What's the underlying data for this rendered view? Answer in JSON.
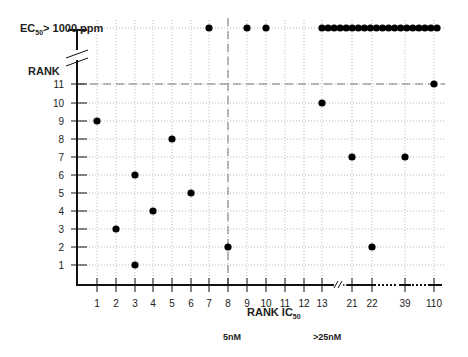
{
  "chart_data": {
    "type": "scatter",
    "title": "",
    "xlabel": "RANK IC50",
    "ylabel": "RANK",
    "top_band_label": "EC50 > 1000 ppm",
    "y_axis_label_main": "EC",
    "y_axis_label_sub": "50",
    "y_axis_label_rest": "> 1000 ppm",
    "x_axis_label_main": "RANK  IC",
    "x_axis_label_sub": "50",
    "annotations": [
      {
        "text": "5nM",
        "at_x_rank": 8
      },
      {
        "text": ">25nM",
        "at_x_rank": 13
      }
    ],
    "x_ticks": [
      "1",
      "2",
      "3",
      "4",
      "5",
      "6",
      "7",
      "8",
      "9",
      "10",
      "11",
      "12",
      "13",
      "21",
      "22",
      "39",
      "110"
    ],
    "y_ticks": [
      "1",
      "2",
      "3",
      "4",
      "5",
      "6",
      "7",
      "8",
      "9",
      "10",
      "11"
    ],
    "reference_lines": [
      {
        "orientation": "horizontal",
        "at_y": 11,
        "style": "dashed"
      },
      {
        "orientation": "vertical",
        "at_x": 8,
        "style": "dashed"
      }
    ],
    "grid": "dotted",
    "axis_breaks": [
      "y between 11 and EC50>1000 ppm",
      "x between 13 and 21",
      "x between 22 and 39",
      "x between 39 and 110"
    ],
    "points": [
      {
        "x": "1",
        "y": "9"
      },
      {
        "x": "2",
        "y": "3"
      },
      {
        "x": "3",
        "y": "6"
      },
      {
        "x": "3",
        "y": "1"
      },
      {
        "x": "4",
        "y": "4"
      },
      {
        "x": "5",
        "y": "8"
      },
      {
        "x": "6",
        "y": "5"
      },
      {
        "x": "8",
        "y": "2"
      },
      {
        "x": "13",
        "y": "10"
      },
      {
        "x": "21",
        "y": "7"
      },
      {
        "x": "22",
        "y": "2"
      },
      {
        "x": "39",
        "y": "7"
      },
      {
        "x": "110",
        "y": "11"
      },
      {
        "x": "7",
        "y": ">1000 ppm"
      },
      {
        "x": "9",
        "y": ">1000 ppm"
      },
      {
        "x": "10",
        "y": ">1000 ppm"
      }
    ],
    "dense_top_row": {
      "from_x": "13",
      "to_x": "110",
      "y": ">1000 ppm",
      "count": 20
    }
  }
}
